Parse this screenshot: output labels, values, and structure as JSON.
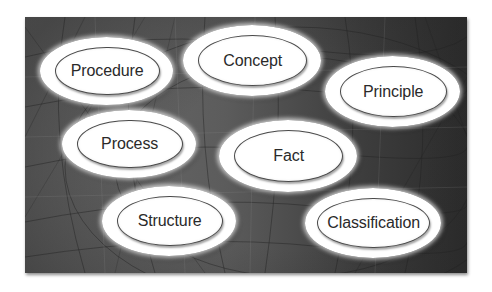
{
  "diagram": {
    "title": "",
    "background": {
      "style": "grayscale abstract wireframe texture",
      "colors": [
        "#6d6d6d",
        "#2b2b2b"
      ]
    },
    "nodes": [
      {
        "id": "procedure",
        "label": "Procedure",
        "x": 40,
        "y": 37,
        "w": 133,
        "h": 68
      },
      {
        "id": "concept",
        "label": "Concept",
        "x": 183,
        "y": 25,
        "w": 138,
        "h": 71
      },
      {
        "id": "principle",
        "label": "Principle",
        "x": 325,
        "y": 56,
        "w": 135,
        "h": 71
      },
      {
        "id": "process",
        "label": "Process",
        "x": 62,
        "y": 110,
        "w": 134,
        "h": 68
      },
      {
        "id": "fact",
        "label": "Fact",
        "x": 219,
        "y": 120,
        "w": 138,
        "h": 72
      },
      {
        "id": "structure",
        "label": "Structure",
        "x": 102,
        "y": 186,
        "w": 134,
        "h": 70
      },
      {
        "id": "classification",
        "label": "Classification",
        "x": 305,
        "y": 188,
        "w": 136,
        "h": 70
      }
    ]
  }
}
